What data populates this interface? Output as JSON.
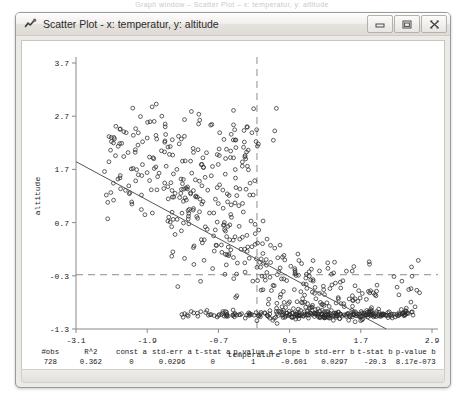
{
  "desktop": {
    "clipped_top_text": "Graph window  –  Scatter Plot  –  x: temperatur, y: altitude"
  },
  "window": {
    "title": "Scatter Plot - x: temperatur, y: altitude",
    "app_icon": "plot-icon",
    "controls": {
      "minimize": "minimize-icon",
      "maximize": "maximize-icon",
      "close": "close-icon"
    }
  },
  "stats": {
    "headers": [
      "#obs",
      "R^2",
      "const a",
      "std-err a",
      "t-stat a",
      "p-value a",
      "slope b",
      "std-err b",
      "t-stat b",
      "p-value b"
    ],
    "values": [
      "728",
      "0.362",
      "0",
      "0.0296",
      "0",
      "1",
      "-0.601",
      "0.0297",
      "-20.3",
      "8.17e-073"
    ]
  },
  "chart_data": {
    "type": "scatter",
    "title": "",
    "xlabel": "temperature",
    "ylabel": "altitude",
    "xlim": [
      -3.1,
      2.9
    ],
    "ylim": [
      -1.3,
      3.7
    ],
    "xticks": [
      -3.1,
      -1.9,
      -0.7,
      0.5,
      1.7,
      2.9
    ],
    "yticks": [
      -1.3,
      -0.3,
      0.7,
      1.7,
      2.7,
      3.7
    ],
    "xtick_labels": [
      "-3.1",
      "-1.9",
      "-0.7",
      "0.5",
      "1.7",
      "2.9"
    ],
    "ytick_labels": [
      "-1.3",
      "-0.3",
      "0.7",
      "1.7",
      "2.7",
      "3.7"
    ],
    "grid": false,
    "legend": null,
    "marker": "open-circle",
    "marker_color": "#2b2b2b",
    "n_points": 728,
    "crosshair": {
      "x": -0.05,
      "y": -0.28,
      "style": "dashed",
      "color": "#8d8d8d"
    },
    "regression_line": {
      "slope": -0.601,
      "intercept": -0.018,
      "color": "#555555",
      "x_start": -3.1,
      "y_start": 1.845,
      "x_end": 2.13,
      "y_end": -1.3
    },
    "points": [
      [
        -2.62,
        1.66
      ],
      [
        -2.47,
        1.44
      ],
      [
        -2.36,
        1.54
      ],
      [
        -2.21,
        1.39
      ],
      [
        -2.1,
        2.07
      ],
      [
        -2.05,
        1.6
      ],
      [
        -1.98,
        1.79
      ],
      [
        -1.9,
        2.29
      ],
      [
        -1.86,
        1.49
      ],
      [
        -1.8,
        1.92
      ],
      [
        -1.74,
        2.27
      ],
      [
        -1.7,
        1.63
      ],
      [
        -1.66,
        2.05
      ],
      [
        -1.62,
        1.34
      ],
      [
        -1.58,
        1.76
      ],
      [
        -1.55,
        2.12
      ],
      [
        -1.5,
        1.45
      ],
      [
        -1.47,
        1.97
      ],
      [
        -1.43,
        1.25
      ],
      [
        -1.4,
        1.7
      ],
      [
        -1.36,
        2.18
      ],
      [
        -1.33,
        1.52
      ],
      [
        -1.29,
        1.1
      ],
      [
        -1.26,
        1.86
      ],
      [
        -1.22,
        1.37
      ],
      [
        -1.19,
        0.95
      ],
      [
        -1.15,
        1.63
      ],
      [
        -1.12,
        2.02
      ],
      [
        -1.08,
        1.2
      ],
      [
        -1.05,
        0.78
      ],
      [
        -1.02,
        1.48
      ],
      [
        -0.98,
        1.05
      ],
      [
        -0.95,
        1.74
      ],
      [
        -0.92,
        0.62
      ],
      [
        -0.88,
        1.31
      ],
      [
        -0.85,
        0.88
      ],
      [
        -0.82,
        1.58
      ],
      [
        -0.78,
        0.45
      ],
      [
        -0.75,
        1.14
      ],
      [
        -0.72,
        0.71
      ],
      [
        -0.68,
        1.41
      ],
      [
        -0.65,
        0.28
      ],
      [
        -0.62,
        0.97
      ],
      [
        -0.58,
        0.54
      ],
      [
        -0.55,
        1.24
      ],
      [
        -0.52,
        0.11
      ],
      [
        -0.48,
        0.8
      ],
      [
        -0.45,
        0.37
      ],
      [
        -0.42,
        1.07
      ],
      [
        -0.38,
        -0.06
      ],
      [
        -0.35,
        0.63
      ],
      [
        -0.32,
        0.2
      ],
      [
        -0.28,
        0.9
      ],
      [
        -0.25,
        -0.23
      ],
      [
        -0.22,
        0.46
      ],
      [
        -0.18,
        0.03
      ],
      [
        -0.15,
        0.73
      ],
      [
        -0.12,
        -0.4
      ],
      [
        -0.08,
        0.29
      ],
      [
        -0.05,
        -0.14
      ],
      [
        -0.02,
        0.56
      ],
      [
        0.02,
        -0.57
      ],
      [
        0.05,
        0.12
      ],
      [
        0.08,
        -0.31
      ],
      [
        0.12,
        0.39
      ],
      [
        0.15,
        -0.74
      ],
      [
        0.18,
        -0.05
      ],
      [
        0.22,
        -0.48
      ],
      [
        0.25,
        0.22
      ],
      [
        0.28,
        -0.91
      ],
      [
        0.32,
        -0.22
      ],
      [
        0.35,
        -0.65
      ],
      [
        0.38,
        0.05
      ],
      [
        0.42,
        -1.08
      ],
      [
        0.45,
        -0.39
      ],
      [
        0.48,
        -0.82
      ],
      [
        0.52,
        -0.12
      ],
      [
        0.55,
        -1.0
      ],
      [
        0.58,
        -0.56
      ],
      [
        0.62,
        -0.99
      ],
      [
        0.65,
        -0.29
      ],
      [
        0.68,
        -1.05
      ],
      [
        0.72,
        -0.73
      ],
      [
        0.75,
        -1.02
      ],
      [
        0.78,
        -0.46
      ],
      [
        0.82,
        -1.04
      ],
      [
        0.85,
        -0.9
      ],
      [
        0.88,
        -1.03
      ],
      [
        0.92,
        -0.63
      ],
      [
        0.95,
        -1.01
      ],
      [
        0.98,
        -1.06
      ],
      [
        1.02,
        -0.8
      ],
      [
        1.05,
        -1.02
      ],
      [
        1.08,
        -1.07
      ],
      [
        1.12,
        -0.97
      ],
      [
        1.15,
        -1.03
      ],
      [
        1.18,
        -0.54
      ],
      [
        1.22,
        -1.05
      ],
      [
        1.25,
        -1.0
      ],
      [
        1.28,
        -1.08
      ],
      [
        1.32,
        -0.71
      ],
      [
        1.35,
        -1.02
      ],
      [
        1.38,
        -1.06
      ],
      [
        1.42,
        -0.88
      ],
      [
        1.45,
        -1.04
      ],
      [
        1.48,
        -1.01
      ],
      [
        1.52,
        -1.07
      ],
      [
        1.55,
        -0.95
      ],
      [
        1.58,
        -1.03
      ],
      [
        1.62,
        -1.05
      ],
      [
        1.65,
        -0.78
      ],
      [
        1.68,
        -1.02
      ],
      [
        1.72,
        -1.06
      ],
      [
        1.75,
        -1.0
      ],
      [
        1.78,
        -1.04
      ],
      [
        1.82,
        -1.07
      ],
      [
        1.85,
        -0.62
      ],
      [
        1.88,
        -1.03
      ],
      [
        1.92,
        -1.05
      ],
      [
        1.95,
        -1.01
      ],
      [
        2.02,
        -1.06
      ],
      [
        2.12,
        -1.04
      ],
      [
        2.22,
        -1.02
      ],
      [
        2.32,
        -1.05
      ],
      [
        2.45,
        -1.03
      ],
      [
        2.58,
        -1.04
      ]
    ]
  }
}
